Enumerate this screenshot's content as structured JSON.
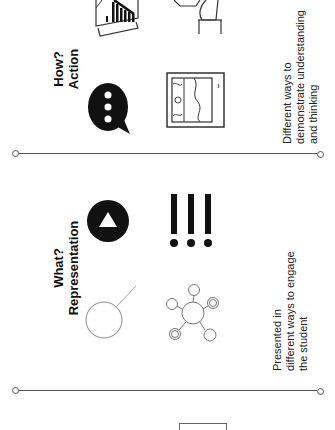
{
  "sections": [
    {
      "id": "action",
      "title_line1": "How?",
      "title_line2": "Action",
      "description": [
        "Different ways to",
        "demonstrate understanding",
        "and thinking"
      ],
      "icons": [
        "speech-bubble-icon",
        "landscape-picture-icon",
        "bar-chart-document-icon",
        "hand-holding-shape-icon"
      ]
    },
    {
      "id": "representation",
      "title_line1": "What?",
      "title_line2": "Representation",
      "description": [
        "Presented in",
        "different ways to engage",
        "the student"
      ],
      "icons": [
        "play-button-icon",
        "exclamation-marks-icon",
        "magnifier-circle-icon",
        "network-nodes-icon"
      ]
    }
  ],
  "colors": {
    "line": "#555555",
    "icon_fill": "#111111",
    "icon_stroke": "#777777"
  }
}
